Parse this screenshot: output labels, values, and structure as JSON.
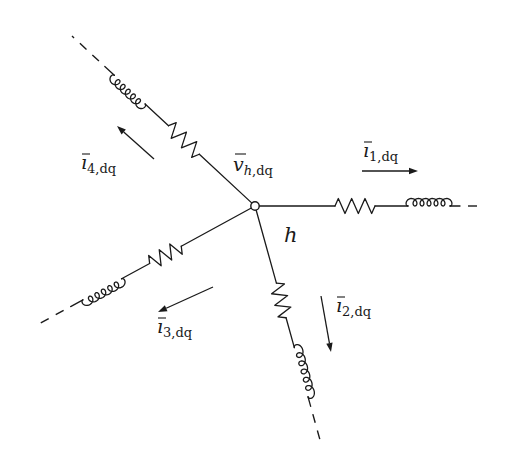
{
  "diagram": {
    "type": "circuit-star-network",
    "node": {
      "name": "h",
      "label": "h",
      "voltage_label": {
        "symbol": "v",
        "subscript_italic": "h",
        "subscript": ",dq"
      }
    },
    "branches": [
      {
        "id": 1,
        "components": [
          "resistor",
          "inductor"
        ],
        "continues": "dashed",
        "current_label": {
          "symbol": "ı",
          "subscript": "1,dq"
        },
        "current_direction": "away-from-node"
      },
      {
        "id": 2,
        "components": [
          "resistor",
          "inductor"
        ],
        "continues": "dashed",
        "current_label": {
          "symbol": "ı",
          "subscript": "2,dq"
        },
        "current_direction": "away-from-node"
      },
      {
        "id": 3,
        "components": [
          "resistor",
          "inductor"
        ],
        "continues": "dashed",
        "current_label": {
          "symbol": "ı",
          "subscript": "3,dq"
        },
        "current_direction": "away-from-node"
      },
      {
        "id": 4,
        "components": [
          "resistor",
          "inductor"
        ],
        "continues": "dashed",
        "current_label": {
          "symbol": "ı",
          "subscript": "4,dq"
        },
        "current_direction": "away-from-node"
      }
    ],
    "colors": {
      "ink": "#1a1a1a",
      "background": "#ffffff"
    }
  }
}
